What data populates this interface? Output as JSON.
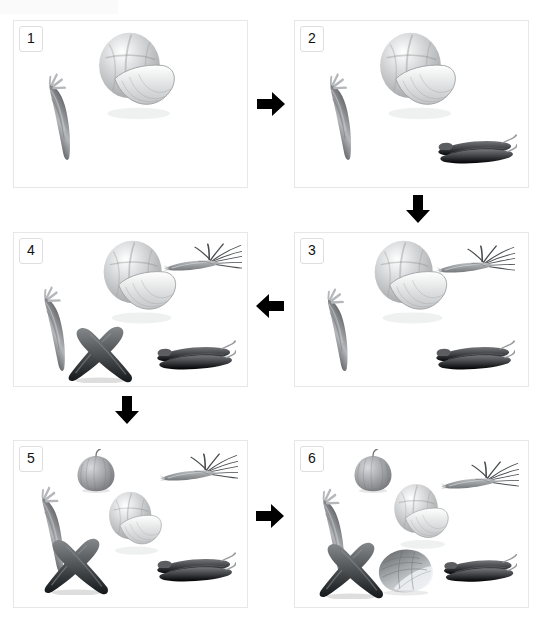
{
  "figure": {
    "background_color": "#ffffff",
    "panel_border_color": "#e6e7e9",
    "arrow_color": "#000000",
    "grid": {
      "columns": 2,
      "rows": 3,
      "flow": "serpentine"
    }
  },
  "panels": [
    {
      "number": "1",
      "label": "panel-1",
      "x": 13,
      "y": 20,
      "width": 235,
      "height": 168,
      "items": [
        {
          "name": "carrot",
          "type": "carrot",
          "x": 20,
          "y": 55,
          "w": 54,
          "h": 86,
          "rot": -28,
          "tone": "#8f9194"
        },
        {
          "name": "cabbage",
          "type": "cabbage",
          "x": 75,
          "y": 8,
          "w": 92,
          "h": 96,
          "rot": 0,
          "tone": "#c3c5c7"
        }
      ]
    },
    {
      "number": "2",
      "label": "panel-2",
      "x": 294,
      "y": 20,
      "width": 235,
      "height": 168,
      "items": [
        {
          "name": "carrot",
          "type": "carrot",
          "x": 20,
          "y": 55,
          "w": 54,
          "h": 86,
          "rot": -28,
          "tone": "#8f9194"
        },
        {
          "name": "cabbage",
          "type": "cabbage",
          "x": 75,
          "y": 8,
          "w": 92,
          "h": 96,
          "rot": 0,
          "tone": "#c3c5c7"
        },
        {
          "name": "chili-peppers",
          "type": "chili",
          "x": 140,
          "y": 106,
          "w": 82,
          "h": 44,
          "rot": 0,
          "tone": "#3d3f42"
        }
      ]
    },
    {
      "number": "3",
      "label": "panel-3",
      "x": 294,
      "y": 232,
      "width": 235,
      "height": 155,
      "items": [
        {
          "name": "carrot",
          "type": "carrot",
          "x": 18,
          "y": 58,
          "w": 52,
          "h": 82,
          "rot": -28,
          "tone": "#8f9194"
        },
        {
          "name": "cabbage",
          "type": "cabbage",
          "x": 70,
          "y": 4,
          "w": 88,
          "h": 92,
          "rot": 0,
          "tone": "#c3c5c7"
        },
        {
          "name": "spring-onions",
          "type": "scallion",
          "x": 142,
          "y": 12,
          "w": 78,
          "h": 42,
          "rot": 0,
          "tone": "#76797c"
        },
        {
          "name": "chili-peppers",
          "type": "chili",
          "x": 138,
          "y": 100,
          "w": 82,
          "h": 44,
          "rot": 0,
          "tone": "#3d3f42"
        }
      ]
    },
    {
      "number": "4",
      "label": "panel-4",
      "x": 13,
      "y": 232,
      "width": 235,
      "height": 155,
      "items": [
        {
          "name": "carrot",
          "type": "carrot",
          "x": 16,
          "y": 56,
          "w": 52,
          "h": 84,
          "rot": -28,
          "tone": "#8f9194"
        },
        {
          "name": "cabbage",
          "type": "cabbage",
          "x": 80,
          "y": 4,
          "w": 88,
          "h": 92,
          "rot": 0,
          "tone": "#c3c5c7"
        },
        {
          "name": "spring-onions",
          "type": "scallion",
          "x": 150,
          "y": 10,
          "w": 78,
          "h": 42,
          "rot": 0,
          "tone": "#76797c"
        },
        {
          "name": "cucumbers",
          "type": "cucumbers",
          "x": 52,
          "y": 88,
          "w": 68,
          "h": 62,
          "rot": 0,
          "tone": "#55585b"
        },
        {
          "name": "chili-peppers",
          "type": "chili",
          "x": 140,
          "y": 100,
          "w": 82,
          "h": 44,
          "rot": 0,
          "tone": "#3d3f42"
        }
      ]
    },
    {
      "number": "5",
      "label": "panel-5",
      "x": 13,
      "y": 440,
      "width": 235,
      "height": 168,
      "items": [
        {
          "name": "onion",
          "type": "onion",
          "x": 60,
          "y": 8,
          "w": 44,
          "h": 44,
          "rot": 0,
          "tone": "#9a9c9f"
        },
        {
          "name": "spring-onions",
          "type": "scallion",
          "x": 146,
          "y": 12,
          "w": 78,
          "h": 42,
          "rot": 0,
          "tone": "#76797c"
        },
        {
          "name": "carrot",
          "type": "carrot",
          "x": 14,
          "y": 48,
          "w": 52,
          "h": 86,
          "rot": -28,
          "tone": "#8f9194"
        },
        {
          "name": "cabbage",
          "type": "cabbage",
          "x": 88,
          "y": 48,
          "w": 64,
          "h": 70,
          "rot": 0,
          "tone": "#c3c5c7"
        },
        {
          "name": "cucumbers",
          "type": "cucumbers",
          "x": 28,
          "y": 92,
          "w": 68,
          "h": 62,
          "rot": 0,
          "tone": "#55585b"
        },
        {
          "name": "chili-peppers",
          "type": "chili",
          "x": 140,
          "y": 104,
          "w": 82,
          "h": 44,
          "rot": 0,
          "tone": "#3d3f42"
        }
      ]
    },
    {
      "number": "6",
      "label": "panel-6",
      "x": 294,
      "y": 440,
      "width": 235,
      "height": 168,
      "items": [
        {
          "name": "onion",
          "type": "onion",
          "x": 56,
          "y": 8,
          "w": 44,
          "h": 44,
          "rot": 0,
          "tone": "#9a9c9f"
        },
        {
          "name": "spring-onions",
          "type": "scallion",
          "x": 146,
          "y": 20,
          "w": 78,
          "h": 42,
          "rot": 0,
          "tone": "#76797c"
        },
        {
          "name": "carrot",
          "type": "carrot",
          "x": 14,
          "y": 50,
          "w": 52,
          "h": 86,
          "rot": -28,
          "tone": "#8f9194"
        },
        {
          "name": "cabbage",
          "type": "cabbage",
          "x": 92,
          "y": 40,
          "w": 66,
          "h": 72,
          "rot": 0,
          "tone": "#c3c5c7"
        },
        {
          "name": "cucumbers",
          "type": "cucumbers",
          "x": 22,
          "y": 96,
          "w": 68,
          "h": 62,
          "rot": 0,
          "tone": "#55585b"
        },
        {
          "name": "napa-cabbage",
          "type": "napa",
          "x": 80,
          "y": 104,
          "w": 62,
          "h": 52,
          "rot": 0,
          "tone": "#8e9194"
        },
        {
          "name": "chili-peppers",
          "type": "chili",
          "x": 146,
          "y": 106,
          "w": 76,
          "h": 42,
          "rot": 0,
          "tone": "#3d3f42"
        }
      ]
    }
  ],
  "arrows": [
    {
      "name": "arrow-1-to-2",
      "direction": "right",
      "x": 255,
      "y": 88,
      "size": 32
    },
    {
      "name": "arrow-2-to-3",
      "direction": "down",
      "x": 402,
      "y": 193,
      "size": 32
    },
    {
      "name": "arrow-3-to-4",
      "direction": "left",
      "x": 254,
      "y": 290,
      "size": 32
    },
    {
      "name": "arrow-4-to-5",
      "direction": "down",
      "x": 111,
      "y": 394,
      "size": 32
    },
    {
      "name": "arrow-5-to-6",
      "direction": "right",
      "x": 254,
      "y": 500,
      "size": 32
    }
  ]
}
